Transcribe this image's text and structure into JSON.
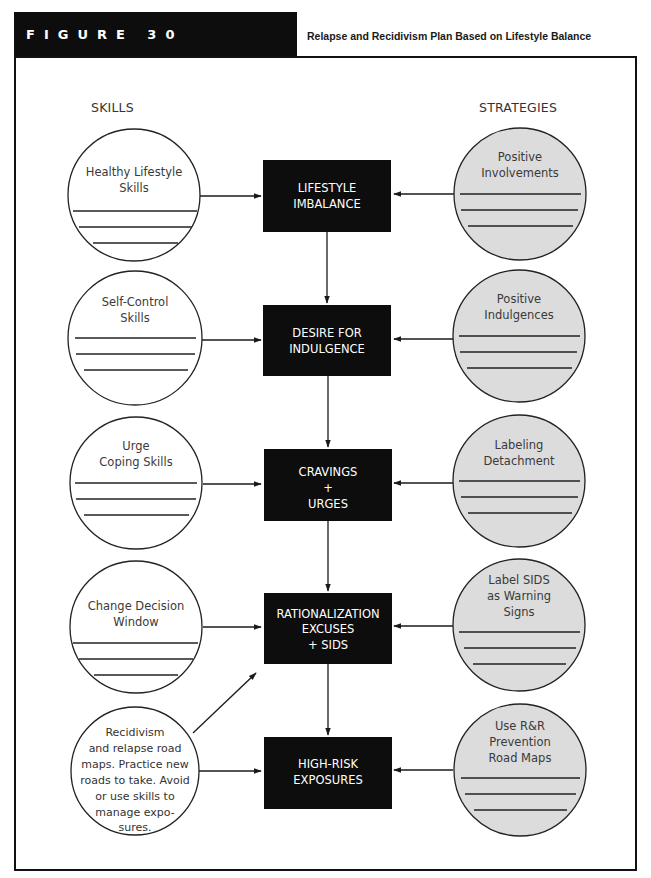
{
  "header": {
    "figure_label": "FIGURE 30",
    "title": "Relapse and Recidivism Plan Based on Lifestyle Balance"
  },
  "columns": {
    "left": "SKILLS",
    "right": "STRATEGIES"
  },
  "colors": {
    "tab_bg": "#0d0d0d",
    "box_bg": "#0d0d0d",
    "box_text": "#ffffff",
    "strategy_fill": "#dcdcdc",
    "skill_fill": "#ffffff",
    "stroke": "#222222"
  },
  "stages": [
    {
      "lines": [
        "LIFESTYLE",
        "IMBALANCE"
      ]
    },
    {
      "lines": [
        "DESIRE FOR",
        "INDULGENCE"
      ]
    },
    {
      "lines": [
        "CRAVINGS",
        "+",
        "URGES"
      ]
    },
    {
      "lines": [
        "RATIONALIZATION",
        "EXCUSES",
        "+ SIDS"
      ]
    },
    {
      "lines": [
        "HIGH-RISK",
        "EXPOSURES"
      ]
    }
  ],
  "skills": [
    {
      "lines": [
        "Healthy Lifestyle",
        "Skills"
      ],
      "write_lines": 3
    },
    {
      "lines": [
        "Self-Control",
        "Skills"
      ],
      "write_lines": 3
    },
    {
      "lines": [
        "Urge",
        "Coping Skills"
      ],
      "write_lines": 3
    },
    {
      "lines": [
        "Change Decision",
        "Window"
      ],
      "write_lines": 3
    },
    {
      "lines": [
        "Recidivism",
        "and relapse road",
        "maps. Practice new",
        "roads to take. Avoid",
        "or use skills to",
        "manage expo-",
        "sures."
      ],
      "write_lines": 0
    }
  ],
  "strategies": [
    {
      "lines": [
        "Positive",
        "Involvements"
      ],
      "write_lines": 3
    },
    {
      "lines": [
        "Positive",
        "Indulgences"
      ],
      "write_lines": 3
    },
    {
      "lines": [
        "Labeling",
        "Detachment"
      ],
      "write_lines": 3
    },
    {
      "lines": [
        "Label SIDS",
        "as Warning",
        "Signs"
      ],
      "write_lines": 3
    },
    {
      "lines": [
        "Use R&R",
        "Prevention",
        "Road Maps"
      ],
      "write_lines": 3
    }
  ]
}
